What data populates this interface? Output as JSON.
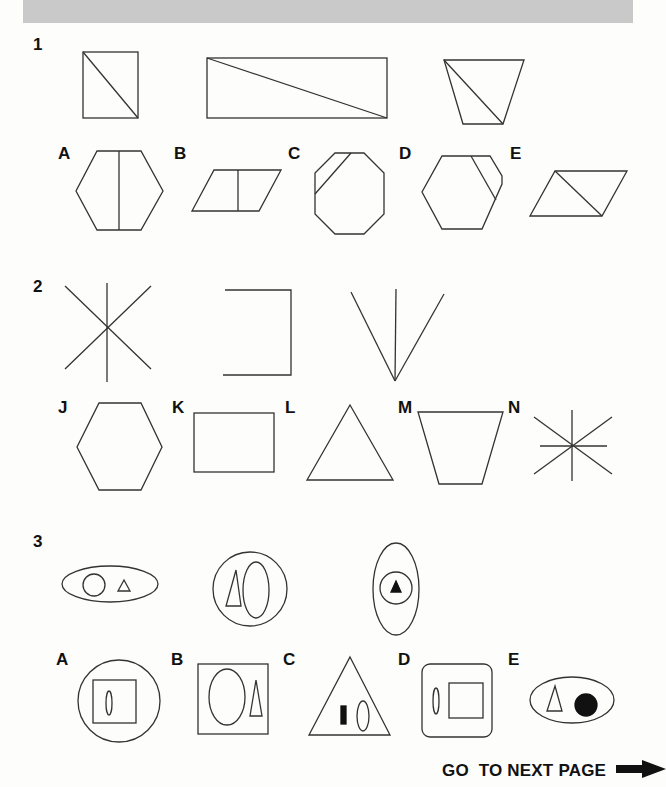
{
  "header": {
    "bar_color": "#c9c9c9"
  },
  "questions": [
    {
      "number": "1",
      "stimuli": [
        "rectangle-with-diagonal",
        "wide-rectangle-with-diagonal",
        "trapezoid-with-diagonal"
      ],
      "options": [
        {
          "letter": "A",
          "figure": "hexagon-with-vertical-line"
        },
        {
          "letter": "B",
          "figure": "parallelogram-with-vertical-line"
        },
        {
          "letter": "C",
          "figure": "octagon-with-corner-line"
        },
        {
          "letter": "D",
          "figure": "hexagon-with-parallel-edge-line"
        },
        {
          "letter": "E",
          "figure": "parallelogram-with-diagonal"
        }
      ]
    },
    {
      "number": "2",
      "stimuli": [
        "six-ray-star",
        "open-bracket-three-sides",
        "three-line-fan"
      ],
      "options": [
        {
          "letter": "J",
          "figure": "hexagon"
        },
        {
          "letter": "K",
          "figure": "rectangle"
        },
        {
          "letter": "L",
          "figure": "triangle"
        },
        {
          "letter": "M",
          "figure": "trapezoid"
        },
        {
          "letter": "N",
          "figure": "eight-ray-star"
        }
      ]
    },
    {
      "number": "3",
      "stimuli": [
        "ellipse-with-circle-and-triangle",
        "circle-with-triangle-and-ellipse",
        "ellipse-with-circle-and-solid-triangle"
      ],
      "options": [
        {
          "letter": "A",
          "figure": "circle-with-square-and-ellipse"
        },
        {
          "letter": "B",
          "figure": "square-with-ellipse-and-triangle"
        },
        {
          "letter": "C",
          "figure": "triangle-with-solid-bar-and-ellipse"
        },
        {
          "letter": "D",
          "figure": "rounded-square-with-ellipse-and-square"
        },
        {
          "letter": "E",
          "figure": "ellipse-with-triangle-and-solid-circle"
        }
      ]
    }
  ],
  "footer": {
    "label": "GO  TO NEXT PAGE",
    "icon": "arrow-right-icon"
  }
}
